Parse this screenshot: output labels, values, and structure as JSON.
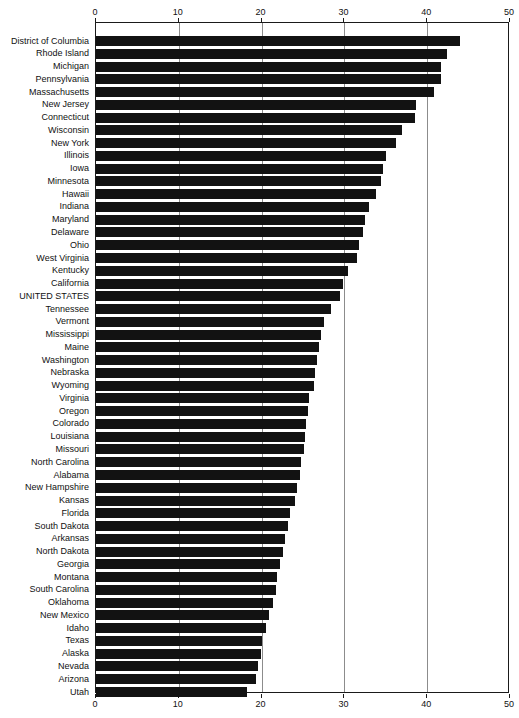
{
  "chart_data": {
    "type": "bar",
    "orientation": "horizontal",
    "title": "",
    "subtitle": "",
    "xlabel": "",
    "ylabel": "",
    "xlim": [
      0,
      50
    ],
    "xticks": [
      0,
      10,
      20,
      30,
      40,
      50
    ],
    "xtick_labels": [
      "0",
      "10",
      "20",
      "30",
      "40",
      "50"
    ],
    "grid": true,
    "grid_axis": "x",
    "legend": false,
    "legend_position": "none",
    "axis_top": true,
    "axis_bottom": true,
    "bar_color": "#121212",
    "categories": [
      "District of Columbia",
      "Rhode Island",
      "Michigan",
      "Pennsylvania",
      "Massachusetts",
      "New Jersey",
      "Connecticut",
      "Wisconsin",
      "New York",
      "Illinois",
      "Iowa",
      "Minnesota",
      "Hawaii",
      "Indiana",
      "Maryland",
      "Delaware",
      "Ohio",
      "West Virginia",
      "Kentucky",
      "California",
      "UNITED STATES",
      "Tennessee",
      "Vermont",
      "Mississippi",
      "Maine",
      "Washington",
      "Nebraska",
      "Wyoming",
      "Virginia",
      "Oregon",
      "Colorado",
      "Louisiana",
      "Missouri",
      "North Carolina",
      "Alabama",
      "New Hampshire",
      "Kansas",
      "Florida",
      "South Dakota",
      "Arkansas",
      "North Dakota",
      "Georgia",
      "Montana",
      "South Carolina",
      "Oklahoma",
      "New Mexico",
      "Idaho",
      "Texas",
      "Alaska",
      "Nevada",
      "Arizona",
      "Utah"
    ],
    "values": [
      44.1,
      42.5,
      41.8,
      41.8,
      41.0,
      38.8,
      38.6,
      37.1,
      36.4,
      35.1,
      34.8,
      34.5,
      33.9,
      33.1,
      32.6,
      32.4,
      31.9,
      31.6,
      30.5,
      30.0,
      29.6,
      28.5,
      27.6,
      27.3,
      27.1,
      26.8,
      26.6,
      26.4,
      25.9,
      25.7,
      25.5,
      25.4,
      25.2,
      24.9,
      24.7,
      24.4,
      24.2,
      23.6,
      23.3,
      23.0,
      22.7,
      22.3,
      22.0,
      21.8,
      21.5,
      21.0,
      20.6,
      20.2,
      20.0,
      19.7,
      19.4,
      18.3
    ],
    "highlight_category": "UNITED STATES"
  }
}
